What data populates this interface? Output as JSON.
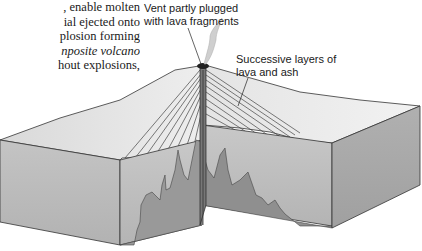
{
  "text": {
    "lines": [
      {
        "before": ", enable molten",
        "italic": "",
        "after": ""
      },
      {
        "before": "ial ejected onto",
        "italic": "",
        "after": ""
      },
      {
        "before": "plosion forming",
        "italic": "",
        "after": ""
      },
      {
        "before": "",
        "italic": "nposite volcano",
        "after": ""
      },
      {
        "before": "hout explosions,",
        "italic": "",
        "after": ""
      }
    ]
  },
  "figure": {
    "labels": {
      "vent": {
        "line1": "Vent partly plugged",
        "line2": "with lava fragments"
      },
      "layers": {
        "line1": "Successive layers of",
        "line2": "lava and ash"
      }
    },
    "colors": {
      "front_face": "#b9b9b9",
      "side_face": "#a9a9a9",
      "top_surface": "#e6e6e6",
      "magma": "#8f8f8f",
      "outline": "#333333",
      "smoke": "#c9c9c9"
    }
  }
}
